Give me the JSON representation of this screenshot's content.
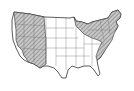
{
  "map": {
    "subject": "Contiguous United States",
    "style": "black-and-white outline with hatched shaded regions",
    "colors": {
      "background": "#ffffff",
      "outline": "#333333",
      "state_borders": "#777777",
      "shaded_fill": "#bdbdbd",
      "hatch": "#555555"
    },
    "regions": [
      {
        "name": "Western mountain region",
        "shaded": true
      },
      {
        "name": "Northeast / Great Lakes / Appalachian region",
        "shaded": true
      }
    ]
  }
}
